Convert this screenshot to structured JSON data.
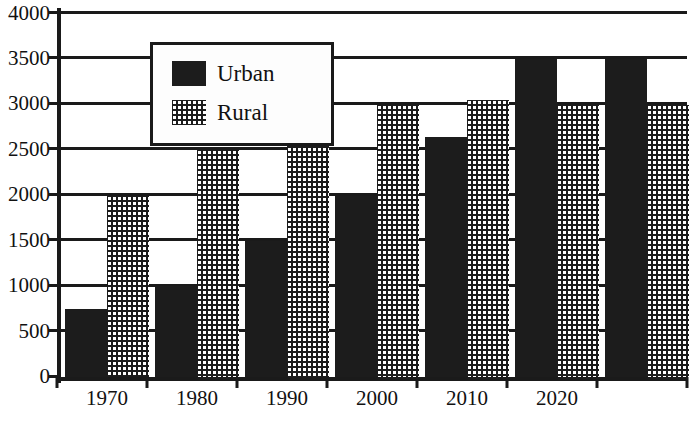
{
  "chart_data": {
    "type": "bar",
    "title": "",
    "subtitle": "",
    "xlabel": "",
    "ylabel": "",
    "categories": [
      "1970",
      "1980",
      "1990",
      "2000",
      "2010",
      "2020"
    ],
    "series": [
      {
        "name": "Urban",
        "values": [
          750,
          1000,
          1500,
          2000,
          2650,
          3500
        ],
        "pattern": "solid-black",
        "color": "#1c1c1c"
      },
      {
        "name": "Rural",
        "values": [
          2000,
          2500,
          2750,
          3000,
          3050,
          3000
        ],
        "pattern": "checkered-dots",
        "color": "#1c1c1c"
      }
    ],
    "ylim": [
      0,
      4000
    ],
    "yticks": [
      0,
      500,
      1000,
      1500,
      2000,
      2500,
      3000,
      3500,
      4000
    ],
    "ytick_labels": [
      "0",
      "500",
      "1000",
      "1500",
      "2000",
      "2500",
      "3000",
      "3500",
      "4000"
    ],
    "grid": true,
    "grid_axis": "y",
    "legend_position": "upper-left-inside",
    "legend_entries": [
      "Urban",
      "Rural"
    ]
  },
  "legend": {
    "entries": [
      {
        "label": "Urban",
        "swatch": "solid-black-swatch"
      },
      {
        "label": "Rural",
        "swatch": "checkered-dot-swatch"
      }
    ]
  },
  "axes": {
    "y_labels": [
      "4000",
      "3500",
      "3000",
      "2500",
      "2000",
      "1500",
      "1000",
      "500",
      "0"
    ],
    "x_labels": [
      "1970",
      "1980",
      "1990",
      "2000",
      "2010",
      "2020"
    ]
  }
}
